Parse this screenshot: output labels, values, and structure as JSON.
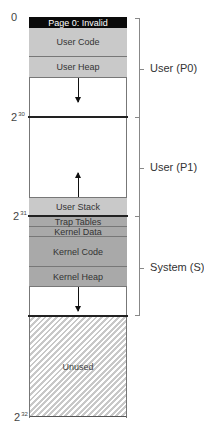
{
  "address_labels": {
    "zero": "0",
    "two_30": {
      "base": "2",
      "exp": "30"
    },
    "two_31": {
      "base": "2",
      "exp": "31"
    },
    "two_32": {
      "base": "2",
      "exp": "32"
    }
  },
  "regions": {
    "page0": "Page 0: Invalid",
    "user_code": "User Code",
    "user_heap": "User Heap",
    "user_stack": "User Stack",
    "trap_tables": "Trap Tables",
    "kernel_data": "Kernel Data",
    "kernel_code": "Kernel Code",
    "kernel_heap": "Kernel Heap",
    "unused": "Unused"
  },
  "segments": {
    "p0": "User (P0)",
    "p1": "User (P1)",
    "system": "System (S)"
  },
  "colors": {
    "user_region": "#c9c9c9",
    "kernel_region": "#a9a9a9",
    "invalid_page": "#0a0a0a"
  }
}
